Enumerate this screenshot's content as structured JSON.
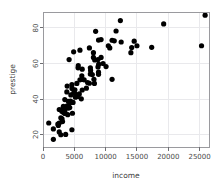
{
  "chart_data": {
    "type": "scatter",
    "title": "",
    "xlabel": "income",
    "ylabel": "prestige",
    "xlim": [
      0,
      26500
    ],
    "ylim": [
      13,
      89
    ],
    "xticks": [
      0,
      5000,
      10000,
      15000,
      20000,
      25000
    ],
    "xtick_labels": [
      "0",
      "5000",
      "10000",
      "15000",
      "20000",
      "25000"
    ],
    "yticks": [
      20,
      40,
      60,
      80
    ],
    "ytick_labels": [
      "20",
      "40",
      "60",
      "80"
    ],
    "grid": true,
    "grid_color": "#e9e9ec",
    "point_color": "#000000",
    "point_size": 3.1,
    "legend": null,
    "x": [
      12351,
      25879,
      9271,
      8865,
      8403,
      11030,
      10660,
      8258,
      8049,
      19263,
      17351,
      14558,
      15000,
      14163,
      11664,
      11377,
      25308,
      14032,
      10432,
      12480,
      7405,
      8780,
      7562,
      9593,
      5902,
      4891,
      8780,
      8049,
      6259,
      7597,
      7870,
      10066,
      8891,
      8865,
      5630,
      5597,
      7558,
      6259,
      11023,
      6197,
      6573,
      8131,
      4168,
      7405,
      5902,
      5403,
      4614,
      5092,
      6259,
      4904,
      4443,
      5571,
      5511,
      3804,
      3858,
      4631,
      5052,
      5511,
      4390,
      4045,
      4397,
      3946,
      4075,
      5299,
      5180,
      4798,
      3485,
      3868,
      4010,
      4265,
      4036,
      3196,
      3250,
      3447,
      3485,
      3211,
      3246,
      2594,
      3000,
      3485,
      3946,
      2847,
      3038,
      3116,
      2594,
      2370,
      2448,
      1656,
      918,
      1656,
      2594,
      2847,
      3617,
      4614,
      8865,
      8206,
      6928,
      5795,
      6112,
      4696,
      9271,
      7122
    ],
    "y": [
      84.2,
      87.2,
      73.5,
      73.2,
      78.1,
      73.1,
      68.8,
      62.0,
      66.1,
      82.3,
      69.1,
      72.6,
      70.0,
      69.0,
      78.3,
      72.8,
      70.0,
      66.1,
      70.0,
      72.1,
      68.8,
      58.1,
      57.6,
      60.0,
      67.5,
      66.6,
      62.2,
      63.4,
      56.8,
      56.1,
      53.8,
      58.3,
      59.6,
      55.1,
      58.8,
      57.6,
      54.1,
      51.1,
      51.1,
      53.1,
      50.8,
      51.1,
      62.2,
      48.9,
      50.8,
      48.8,
      48.1,
      45.2,
      45.1,
      43.5,
      42.3,
      42.2,
      41.5,
      44.0,
      47.3,
      46.0,
      43.2,
      41.5,
      38.9,
      38.7,
      38.1,
      35.9,
      36.2,
      41.8,
      41.0,
      38.1,
      39.7,
      36.2,
      35.6,
      35.2,
      34.9,
      34.8,
      35.9,
      34.2,
      33.3,
      32.8,
      32.5,
      34.1,
      33.1,
      31.9,
      31.2,
      29.4,
      28.8,
      27.3,
      26.5,
      25.9,
      25.1,
      23.2,
      26.5,
      17.3,
      21.5,
      19.9,
      20.1,
      22.7,
      53.9,
      48.8,
      46.1,
      42.9,
      40.1,
      32.0,
      63.4,
      49.3
    ]
  },
  "plot_geometry": {
    "panel_left": 43,
    "panel_top": 12,
    "panel_right": 209,
    "panel_bottom": 147
  }
}
